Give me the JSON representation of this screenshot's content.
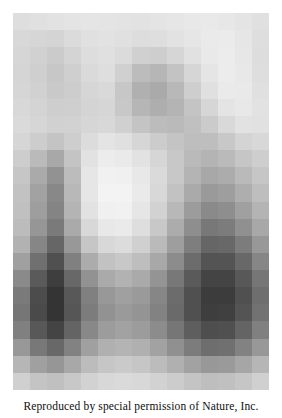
{
  "figure": {
    "name": "pixelated-portrait",
    "alt_description": "Block-averaged grayscale portrait of a bearded man",
    "caption": "Reproduced by special permission of Nature, Inc.",
    "background_color": "#ffffff",
    "image_area": {
      "left": 13,
      "top": 13,
      "width": 256,
      "height": 377
    }
  },
  "chart_data": {
    "type": "heatmap",
    "title": "",
    "xlabel": "",
    "ylabel": "",
    "grid": false,
    "legend": "none",
    "colormap": "grayscale",
    "value_range": [
      0,
      255
    ],
    "cols": 15,
    "rows": 22,
    "values": [
      [
        222,
        224,
        226,
        228,
        229,
        228,
        227,
        226,
        228,
        230,
        232,
        233,
        231,
        228,
        224
      ],
      [
        216,
        214,
        212,
        219,
        224,
        226,
        224,
        221,
        222,
        226,
        230,
        234,
        235,
        230,
        222
      ],
      [
        214,
        209,
        203,
        212,
        221,
        224,
        219,
        208,
        206,
        214,
        225,
        233,
        236,
        231,
        221
      ],
      [
        213,
        207,
        199,
        207,
        218,
        222,
        208,
        188,
        182,
        195,
        214,
        229,
        236,
        232,
        222
      ],
      [
        214,
        209,
        201,
        205,
        214,
        217,
        199,
        176,
        170,
        184,
        206,
        224,
        234,
        233,
        224
      ],
      [
        216,
        212,
        206,
        207,
        212,
        214,
        200,
        182,
        174,
        180,
        196,
        214,
        228,
        232,
        226
      ],
      [
        218,
        214,
        209,
        210,
        214,
        216,
        208,
        196,
        188,
        186,
        192,
        203,
        217,
        226,
        225
      ],
      [
        214,
        205,
        196,
        206,
        220,
        228,
        224,
        214,
        204,
        196,
        190,
        190,
        200,
        212,
        216
      ],
      [
        205,
        186,
        168,
        196,
        226,
        236,
        234,
        226,
        214,
        200,
        186,
        180,
        186,
        198,
        206
      ],
      [
        198,
        170,
        146,
        188,
        230,
        241,
        240,
        232,
        218,
        200,
        180,
        168,
        172,
        186,
        198
      ],
      [
        194,
        162,
        136,
        184,
        230,
        243,
        243,
        234,
        216,
        194,
        170,
        154,
        158,
        174,
        190
      ],
      [
        192,
        158,
        132,
        180,
        226,
        240,
        241,
        230,
        210,
        184,
        156,
        138,
        142,
        160,
        180
      ],
      [
        188,
        150,
        122,
        170,
        216,
        232,
        234,
        222,
        200,
        172,
        142,
        120,
        124,
        144,
        168
      ],
      [
        178,
        134,
        102,
        152,
        198,
        216,
        220,
        208,
        186,
        158,
        126,
        102,
        104,
        124,
        152
      ],
      [
        160,
        112,
        80,
        128,
        172,
        194,
        200,
        190,
        168,
        140,
        108,
        84,
        84,
        104,
        134
      ],
      [
        138,
        90,
        62,
        104,
        146,
        170,
        178,
        170,
        148,
        120,
        90,
        68,
        68,
        88,
        118
      ],
      [
        122,
        76,
        52,
        88,
        128,
        152,
        160,
        154,
        134,
        108,
        80,
        60,
        60,
        80,
        110
      ],
      [
        118,
        74,
        52,
        86,
        124,
        146,
        154,
        148,
        130,
        106,
        80,
        62,
        64,
        84,
        114
      ],
      [
        128,
        88,
        68,
        100,
        136,
        156,
        162,
        156,
        140,
        118,
        94,
        78,
        80,
        100,
        128
      ],
      [
        152,
        120,
        104,
        130,
        160,
        176,
        180,
        176,
        162,
        144,
        124,
        110,
        112,
        130,
        152
      ],
      [
        182,
        160,
        150,
        168,
        188,
        198,
        202,
        198,
        188,
        176,
        162,
        152,
        154,
        166,
        182
      ],
      [
        208,
        196,
        192,
        200,
        210,
        216,
        218,
        216,
        210,
        204,
        196,
        190,
        192,
        198,
        208
      ]
    ]
  }
}
